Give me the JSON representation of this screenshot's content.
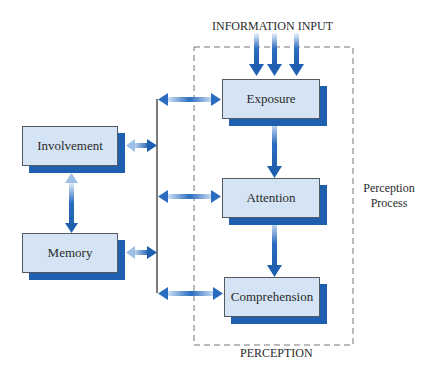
{
  "diagram": {
    "top_label": "INFORMATION INPUT",
    "bottom_label": "PERCEPTION",
    "side_label_line1": "Perception",
    "side_label_line2": "Process",
    "boxes": {
      "exposure": "Exposure",
      "attention": "Attention",
      "comprehension": "Comprehension",
      "involvement": "Involvement",
      "memory": "Memory"
    },
    "colors": {
      "box_fill": "#d4e4f4",
      "box_shadow": "#1f5fb0",
      "arrow": "#2a6cc0",
      "dashed_border": "#777777",
      "connector_line": "#333333"
    }
  }
}
